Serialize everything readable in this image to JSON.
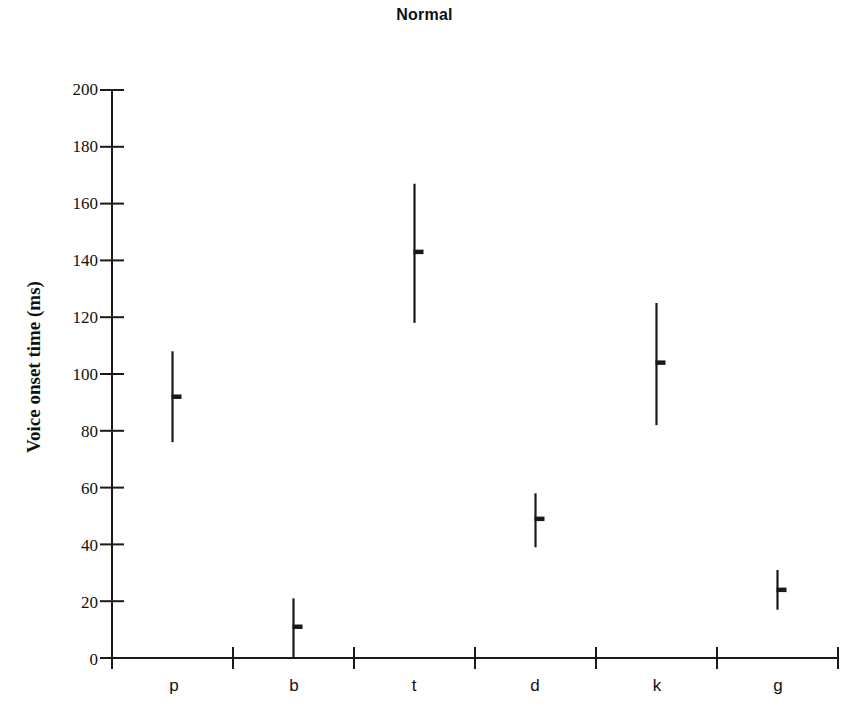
{
  "chart_data": {
    "type": "scatter",
    "title": "Normal",
    "xlabel": "",
    "ylabel": "Voice onset time (ms)",
    "categories": [
      "p",
      "b",
      "t",
      "d",
      "k",
      "g"
    ],
    "series": [
      {
        "name": "Voice onset time",
        "values": [
          92,
          11,
          143,
          49,
          104,
          24
        ],
        "error_low": [
          76,
          0,
          118,
          39,
          82,
          17
        ],
        "error_high": [
          108,
          21,
          167,
          58,
          125,
          31
        ]
      }
    ],
    "ylim": [
      0,
      200
    ],
    "yticks": [
      0,
      20,
      40,
      60,
      80,
      100,
      120,
      140,
      160,
      180,
      200
    ],
    "ytick_labels": [
      "0",
      "20",
      "40",
      "60",
      "80",
      "100",
      "120",
      "140",
      "160",
      "180",
      "200"
    ],
    "grid": false,
    "legend": "none",
    "marker_style": "mean-tick-with-range-bar",
    "line_color": "#1a1a1a"
  },
  "axes": {
    "y_axis_name": "y-axis",
    "x_axis_name": "x-axis"
  }
}
